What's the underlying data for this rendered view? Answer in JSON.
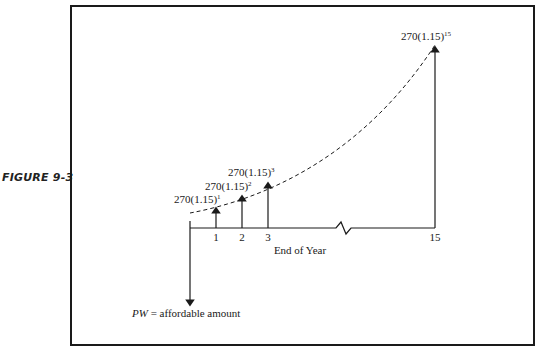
{
  "figure": {
    "label": "FIGURE 9-3"
  },
  "diagram": {
    "type": "cash-flow-diagram",
    "axis_label": "End of Year",
    "pw_label_italic": "PW",
    "pw_label_rest": " = affordable amount",
    "break_between": [
      "3",
      "15"
    ],
    "ticks": [
      {
        "label": "1"
      },
      {
        "label": "2"
      },
      {
        "label": "3"
      },
      {
        "label": "15"
      }
    ],
    "cash_flows": [
      {
        "year": "1",
        "base": "270(1.15)",
        "exponent": "1"
      },
      {
        "year": "2",
        "base": "270(1.15)",
        "exponent": "2"
      },
      {
        "year": "3",
        "base": "270(1.15)",
        "exponent": "3"
      },
      {
        "year": "15",
        "base": "270(1.15)",
        "exponent": "15"
      }
    ],
    "growth_curve": "dashed",
    "colors": {
      "line": "#1a1a1a",
      "background": "#ffffff"
    }
  }
}
